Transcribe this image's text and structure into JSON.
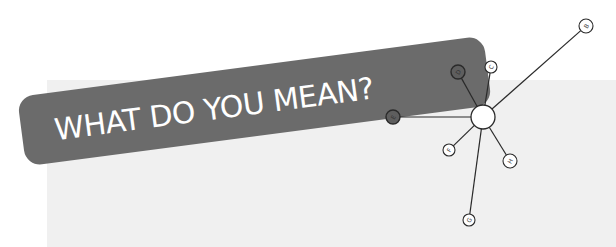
{
  "banner": {
    "title": "WHAT DO YOU MEAN?",
    "color": "#6b6b6b",
    "text_color": "#ffffff"
  },
  "panel": {
    "color": "#f0f0f0"
  },
  "diagram": {
    "type": "star",
    "hub": {
      "id": "hub",
      "label": "",
      "cx": 483,
      "cy": 117,
      "r": 12
    },
    "nodes": [
      {
        "id": "B",
        "label": "B",
        "cx": 586,
        "cy": 26,
        "r": 7,
        "filled": false
      },
      {
        "id": "C",
        "label": "C",
        "cx": 491,
        "cy": 67,
        "r": 6,
        "filled": false
      },
      {
        "id": "D",
        "label": "D",
        "cx": 458,
        "cy": 72,
        "r": 7,
        "filled": true
      },
      {
        "id": "E",
        "label": "E",
        "cx": 393,
        "cy": 117,
        "r": 7,
        "filled": true
      },
      {
        "id": "F",
        "label": "F",
        "cx": 449,
        "cy": 150,
        "r": 6,
        "filled": false
      },
      {
        "id": "G",
        "label": "G",
        "cx": 469,
        "cy": 220,
        "r": 6,
        "filled": false
      },
      {
        "id": "H",
        "label": "H",
        "cx": 510,
        "cy": 161,
        "r": 7,
        "filled": false
      }
    ],
    "edges": [
      [
        "hub",
        "B"
      ],
      [
        "hub",
        "C"
      ],
      [
        "hub",
        "D"
      ],
      [
        "hub",
        "E"
      ],
      [
        "hub",
        "F"
      ],
      [
        "hub",
        "G"
      ],
      [
        "hub",
        "H"
      ]
    ],
    "colors": {
      "edge": "#2a2a2a",
      "node_fill": "#ffffff",
      "node_fill_dark": "#5e5e5e",
      "node_stroke": "#2a2a2a"
    }
  }
}
